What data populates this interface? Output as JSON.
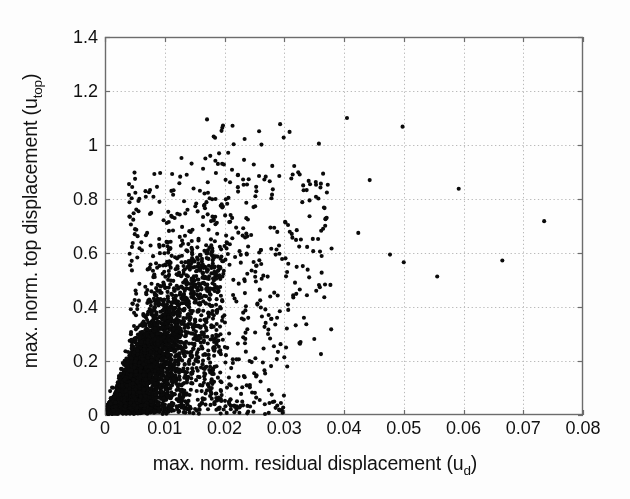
{
  "chart_data": {
    "type": "scatter",
    "title": "",
    "xlabel": "max. norm. residual displacement (u_d)",
    "xlabel_main": "max. norm. residual displacement (u",
    "xlabel_sub": "d",
    "xlabel_tail": ")",
    "ylabel": "max. norm. top displacement (u_top)",
    "ylabel_main": "max. norm. top displacement (u",
    "ylabel_sub": "top",
    "ylabel_tail": ")",
    "xlim": [
      0,
      0.08
    ],
    "ylim": [
      0,
      1.4
    ],
    "xticks": [
      0,
      0.01,
      0.02,
      0.03,
      0.04,
      0.05,
      0.06,
      0.07,
      0.08
    ],
    "yticks": [
      0,
      0.2,
      0.4,
      0.6,
      0.8,
      1,
      1.2,
      1.4
    ],
    "xtick_labels": [
      "0",
      "0.01",
      "0.02",
      "0.03",
      "0.04",
      "0.05",
      "0.06",
      "0.07",
      "0.08"
    ],
    "ytick_labels": [
      "0",
      "0.2",
      "0.4",
      "0.6",
      "0.8",
      "1",
      "1.2",
      "1.4"
    ],
    "grid": true,
    "grid_style": "dotted",
    "grid_color": "#b9b9b9",
    "legend": null,
    "marker": "circle",
    "marker_color": "#0a0a0a",
    "marker_size_px": 4.1,
    "n_points_approx": 2600,
    "notable_points": [
      [
        0.0405,
        1.1
      ],
      [
        0.0498,
        1.068
      ],
      [
        0.0358,
        1.005
      ],
      [
        0.0128,
        0.952
      ],
      [
        0.0168,
        0.95
      ],
      [
        0.0189,
        0.93
      ],
      [
        0.0199,
        0.928
      ],
      [
        0.0249,
        0.928
      ],
      [
        0.0443,
        0.87
      ],
      [
        0.0592,
        0.838
      ],
      [
        0.0087,
        0.845
      ],
      [
        0.0172,
        0.862
      ],
      [
        0.0232,
        0.853
      ],
      [
        0.0253,
        0.845
      ],
      [
        0.0735,
        0.718
      ],
      [
        0.0665,
        0.572
      ],
      [
        0.05,
        0.566
      ],
      [
        0.0477,
        0.594
      ],
      [
        0.0556,
        0.513
      ],
      [
        0.0303,
        0.25
      ],
      [
        0.0288,
        0.36
      ]
    ],
    "series": [
      {
        "name": "samples",
        "generator": "wedge-cloud",
        "x_mode": 0.0065,
        "y_over_x_slope_mean": 26,
        "y_over_x_slope_spread": 14
      }
    ]
  },
  "axes": {
    "plot_left_px": 105,
    "plot_top_px": 37,
    "plot_right_px": 583,
    "plot_bottom_px": 415,
    "frame_color": "#6c6c6c",
    "background": "#fdfdfd",
    "plot_background": "#fefefe"
  }
}
